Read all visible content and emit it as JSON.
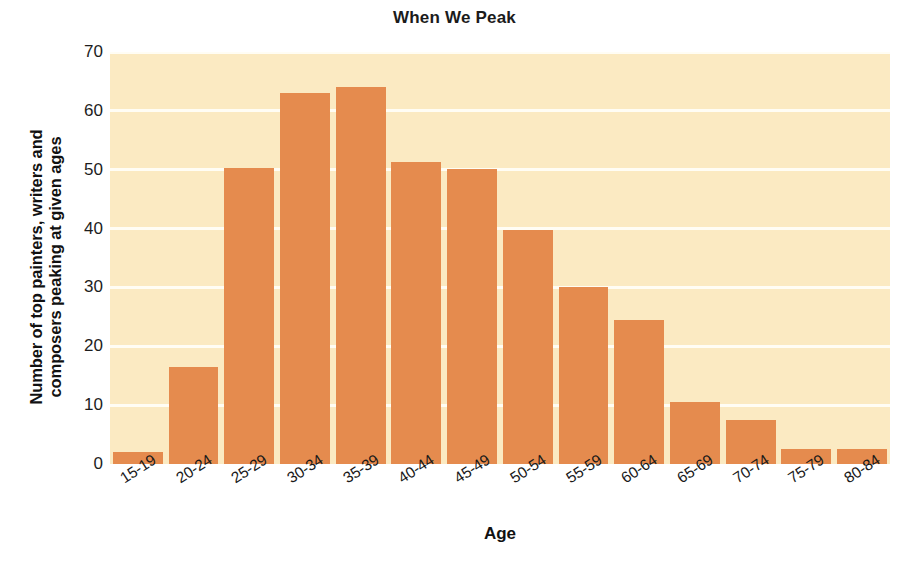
{
  "chart_data": {
    "type": "bar",
    "title": "When We Peak",
    "xlabel": "Age",
    "ylabel": "Number of top painters, writers and\ncomposers peaking at given ages",
    "ylabel_line1": "Number of top painters, writers and",
    "ylabel_line2": "composers peaking at given ages",
    "categories": [
      "15-19",
      "20-24",
      "25-29",
      "30-34",
      "35-39",
      "40-44",
      "45-49",
      "50-54",
      "55-59",
      "60-64",
      "65-69",
      "70-74",
      "75-79",
      "80-84"
    ],
    "values": [
      2,
      16.5,
      50.3,
      63,
      64,
      51.3,
      50.2,
      39.8,
      30,
      24.5,
      10.5,
      7.5,
      2.5,
      2.5
    ],
    "ylim": [
      0,
      70
    ],
    "yticks": [
      0,
      10,
      20,
      30,
      40,
      50,
      60,
      70
    ],
    "ytick_labels": [
      "0",
      "10",
      "20",
      "30",
      "40",
      "50",
      "60",
      "70"
    ],
    "grid": true,
    "grid_axis": "y",
    "legend": null,
    "legend_position": "none",
    "bar_color": "#e58b4e",
    "plot_background": "#fbeac2",
    "gridline_color": "#fffdf4",
    "figure_background": "#ffffff",
    "text_color": "#111111"
  }
}
